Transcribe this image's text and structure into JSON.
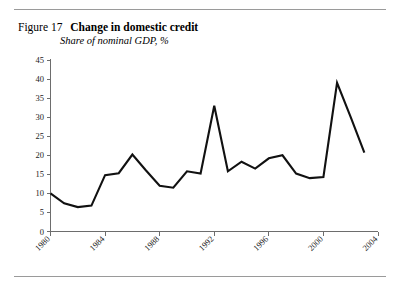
{
  "figure": {
    "number_label": "Figure 17",
    "title": "Change in domestic credit",
    "subtitle": "Share of nominal GDP, %"
  },
  "chart_data": {
    "type": "line",
    "title": "Change in domestic credit",
    "subtitle": "Share of nominal GDP, %",
    "xlabel": "",
    "ylabel": "",
    "ylim": [
      0,
      45
    ],
    "xlim": [
      1980,
      2004
    ],
    "grid": false,
    "legend": null,
    "y_ticks": [
      0,
      5,
      10,
      15,
      20,
      25,
      30,
      35,
      40,
      45
    ],
    "x_ticks": [
      1980,
      1984,
      1988,
      1992,
      1996,
      2000,
      2004
    ],
    "x_tick_labels": [
      "1980",
      "1984",
      "1988",
      "1992",
      "1996",
      "2000",
      "2004"
    ],
    "x_tick_label_rotation": 45,
    "series": [
      {
        "name": "Change in domestic credit",
        "color": "#111111",
        "x": [
          1980,
          1981,
          1982,
          1983,
          1984,
          1985,
          1986,
          1987,
          1988,
          1989,
          1990,
          1991,
          1992,
          1993,
          1994,
          1995,
          1996,
          1997,
          1998,
          1999,
          2000,
          2001,
          2002,
          2003
        ],
        "values": [
          10.0,
          7.4,
          6.4,
          6.8,
          14.8,
          15.3,
          20.2,
          16.0,
          12.0,
          11.5,
          15.8,
          15.2,
          33.0,
          15.8,
          18.3,
          16.5,
          19.2,
          20.0,
          15.2,
          14.0,
          14.3,
          39.0,
          30.0,
          20.7
        ]
      }
    ]
  }
}
